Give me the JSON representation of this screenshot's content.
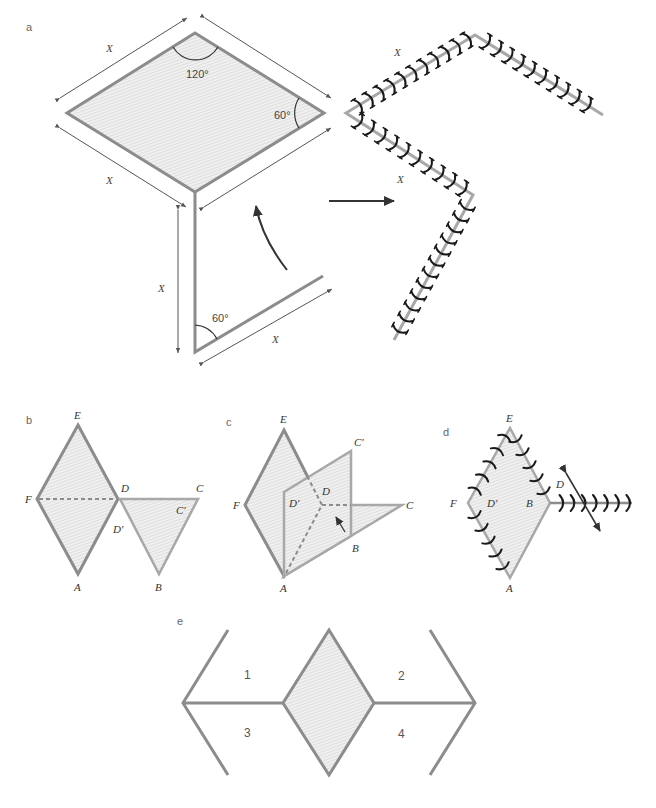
{
  "panels": {
    "a": {
      "label": "a",
      "angle_top": "120°",
      "angle_right": "60°",
      "angle_strip": "60°",
      "dim_labels": [
        "X",
        "X",
        "X",
        "X",
        "X",
        "X"
      ]
    },
    "b": {
      "label": "b",
      "vertices": {
        "E": "E",
        "F": "F",
        "D": "D",
        "C": "C",
        "Cp": "C'",
        "Dp": "D'",
        "A": "A",
        "B": "B"
      }
    },
    "c": {
      "label": "c",
      "vertices": {
        "E": "E",
        "Cp": "C'",
        "D": "D",
        "F": "F",
        "Dp": "D'",
        "C": "C",
        "B": "B",
        "A": "A"
      }
    },
    "d": {
      "label": "d",
      "vertices": {
        "E": "E",
        "D": "D",
        "F": "F",
        "Dp": "D'",
        "B": "B",
        "A": "A"
      }
    },
    "e": {
      "label": "e",
      "regions": [
        "1",
        "2",
        "3",
        "4"
      ]
    }
  },
  "colors": {
    "edge": "#8c8c8c",
    "fill": "#e6e6e6",
    "stitch": "#1a1a1a",
    "arrow": "#333333"
  }
}
